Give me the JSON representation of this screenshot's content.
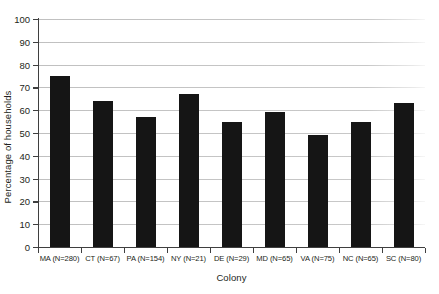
{
  "chart_data": {
    "type": "bar",
    "title": "",
    "xlabel": "Colony",
    "ylabel": "Percentage of households",
    "categories": [
      "MA (N=280)",
      "CT (N=67)",
      "PA (N=154)",
      "NY (N=21)",
      "DE (N=29)",
      "MD (N=65)",
      "VA (N=75)",
      "NC (N=65)",
      "SC (N=80)"
    ],
    "values": [
      75,
      64,
      57,
      67,
      55,
      59,
      49,
      55,
      63
    ],
    "ylim": [
      0,
      100
    ],
    "ytick_labels": [
      "0",
      "10",
      "20",
      "30",
      "40",
      "50",
      "60",
      "70",
      "80",
      "90",
      "100"
    ],
    "yticks": [
      0,
      10,
      20,
      30,
      40,
      50,
      60,
      70,
      80,
      90,
      100
    ],
    "grid": "horizontal",
    "legend": "none",
    "bar_color": "#151515",
    "grid_color": "#c8c8c8",
    "axis_color": "#3f3f3f",
    "text_color": "#231f20"
  }
}
